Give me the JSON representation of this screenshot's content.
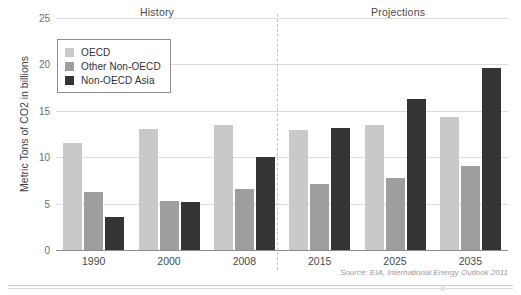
{
  "figure": {
    "title_remnant": "",
    "source_note": "Source: EIA, International Energy Outlook 2011",
    "section_labels": {
      "history": "History",
      "projections": "Projections"
    }
  },
  "legend": {
    "items": [
      {
        "label": "OECD",
        "color": "#c9c9c9"
      },
      {
        "label": "Other Non-OECD",
        "color": "#9e9e9e"
      },
      {
        "label": "Non-OECD Asia",
        "color": "#343434"
      }
    ]
  },
  "axis": {
    "y_title": "Metric Tons of CO2 in billions",
    "y_ticks": [
      "0",
      "5",
      "10",
      "15",
      "20",
      "25"
    ],
    "x_ticks": [
      "1990",
      "2000",
      "2008",
      "2015",
      "2025",
      "2035"
    ]
  },
  "chart_data": {
    "type": "bar",
    "title": "",
    "subtitle": "",
    "xlabel": "",
    "ylabel": "Metric Tons of CO2 in billions",
    "categories": [
      "1990",
      "2000",
      "2008",
      "2015",
      "2025",
      "2035"
    ],
    "series": [
      {
        "name": "OECD",
        "color": "#c9c9c9",
        "values": [
          11.5,
          13.0,
          13.5,
          12.9,
          13.5,
          14.3
        ]
      },
      {
        "name": "Other Non-OECD",
        "color": "#9e9e9e",
        "values": [
          6.2,
          5.3,
          6.6,
          7.1,
          7.8,
          9.1
        ]
      },
      {
        "name": "Non-OECD Asia",
        "color": "#343434",
        "values": [
          3.6,
          5.2,
          10.0,
          13.2,
          16.3,
          19.6
        ]
      }
    ],
    "ylim": [
      0,
      25
    ],
    "ytick_values": [
      0,
      5,
      10,
      15,
      20,
      25
    ],
    "grid": "horizontal",
    "legend_position": "inside-top-left",
    "annotations": [
      {
        "text": "History",
        "region": "left-of-divider"
      },
      {
        "text": "Projections",
        "region": "right-of-divider"
      },
      {
        "text": "Source: EIA, International Energy Outlook 2011",
        "region": "bottom-right"
      }
    ],
    "divider": {
      "after_category": "2008",
      "style": "dashed"
    }
  }
}
